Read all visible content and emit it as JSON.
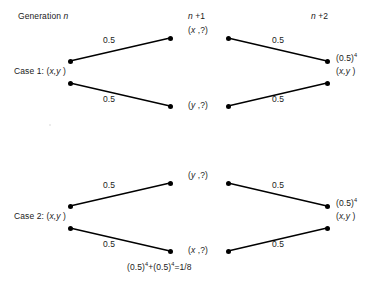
{
  "diagram": {
    "title_absent": true,
    "headers": [
      {
        "id": "gen-n",
        "text": "Generation n",
        "x": 18,
        "y": 12
      },
      {
        "id": "gen-n1",
        "text": "n +1",
        "x": 188,
        "y": 12
      },
      {
        "id": "gen-n2",
        "text": "n +2",
        "x": 311,
        "y": 12
      }
    ],
    "cases": [
      {
        "id": "case-1",
        "label": "Case 1: (x,y )",
        "label_x": 14,
        "label_y": 67,
        "mid_top_label": "(x ,?)",
        "mid_top_x": 188,
        "mid_top_y": 26,
        "mid_bottom_label": "(y ,?)",
        "mid_bottom_x": 188,
        "mid_bottom_y": 101,
        "result_power": "(0.5)",
        "result_exponent": "4",
        "result_pair": "(x,y )",
        "result_x": 336,
        "result_y": 54,
        "weights": [
          {
            "text": "0.5",
            "x": 103,
            "y": 36
          },
          {
            "text": "0.5",
            "x": 103,
            "y": 95
          },
          {
            "text": "0.5",
            "x": 272,
            "y": 36
          },
          {
            "text": "0.5",
            "x": 272,
            "y": 95
          }
        ],
        "nodes": [
          {
            "id": "c1-left-upper",
            "x": 70,
            "y": 61
          },
          {
            "id": "c1-left-lower",
            "x": 70,
            "y": 83
          },
          {
            "id": "c1-mid-upper-in",
            "x": 170,
            "y": 38
          },
          {
            "id": "c1-mid-lower-in",
            "x": 170,
            "y": 106
          },
          {
            "id": "c1-mid-upper-out",
            "x": 228,
            "y": 38
          },
          {
            "id": "c1-mid-lower-out",
            "x": 228,
            "y": 106
          },
          {
            "id": "c1-right-upper",
            "x": 327,
            "y": 61
          },
          {
            "id": "c1-right-lower",
            "x": 327,
            "y": 83
          }
        ],
        "edges": [
          {
            "from": "c1-left-upper",
            "to": "c1-mid-upper-in"
          },
          {
            "from": "c1-left-lower",
            "to": "c1-mid-lower-in"
          },
          {
            "from": "c1-mid-upper-out",
            "to": "c1-right-upper"
          },
          {
            "from": "c1-mid-lower-out",
            "to": "c1-right-lower"
          }
        ]
      },
      {
        "id": "case-2",
        "label": "Case 2: (x,y )",
        "label_x": 14,
        "label_y": 212,
        "mid_top_label": "(y ,?)",
        "mid_top_x": 188,
        "mid_top_y": 171,
        "mid_bottom_label": "(x ,?)",
        "mid_bottom_x": 188,
        "mid_bottom_y": 246,
        "result_power": "(0.5)",
        "result_exponent": "4",
        "result_pair": "(x,y )",
        "result_x": 336,
        "result_y": 199,
        "weights": [
          {
            "text": "0.5",
            "x": 103,
            "y": 181
          },
          {
            "text": "0.5",
            "x": 103,
            "y": 240
          },
          {
            "text": "0.5",
            "x": 272,
            "y": 181
          },
          {
            "text": "0.5",
            "x": 272,
            "y": 240
          }
        ],
        "nodes": [
          {
            "id": "c2-left-upper",
            "x": 70,
            "y": 206
          },
          {
            "id": "c2-left-lower",
            "x": 70,
            "y": 228
          },
          {
            "id": "c2-mid-upper-in",
            "x": 170,
            "y": 183
          },
          {
            "id": "c2-mid-lower-in",
            "x": 170,
            "y": 251
          },
          {
            "id": "c2-mid-upper-out",
            "x": 228,
            "y": 183
          },
          {
            "id": "c2-mid-lower-out",
            "x": 228,
            "y": 251
          },
          {
            "id": "c2-right-upper",
            "x": 327,
            "y": 206
          },
          {
            "id": "c2-right-lower",
            "x": 327,
            "y": 228
          }
        ],
        "edges": [
          {
            "from": "c2-left-upper",
            "to": "c2-mid-upper-in"
          },
          {
            "from": "c2-left-lower",
            "to": "c2-mid-lower-in"
          },
          {
            "from": "c2-mid-upper-out",
            "to": "c2-right-upper"
          },
          {
            "from": "c2-mid-lower-out",
            "to": "c2-right-lower"
          }
        ]
      }
    ],
    "formula": {
      "text": "(0.5)⁴+(0.5)⁴=1/8",
      "base": "(0.5)",
      "exponent": "4",
      "plus": "+",
      "equals": "=1/8",
      "x": 127,
      "y": 263
    },
    "style": {
      "line_color": "#000000",
      "node_color": "#000000",
      "text_color": "#1a1a1a",
      "background": "#ffffff",
      "line_width": 1.4,
      "node_radius": 2.5
    }
  }
}
